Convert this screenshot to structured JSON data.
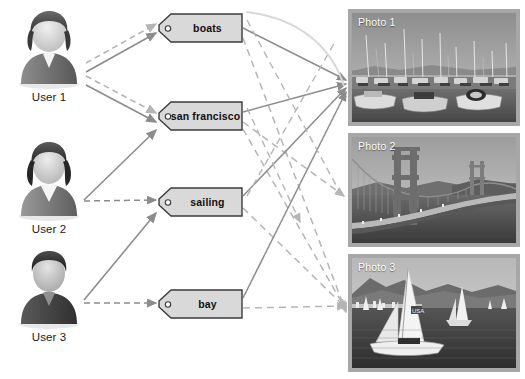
{
  "diagram": {
    "type": "tripartite-graph",
    "colors": {
      "tag_fill": "#d9d9d9",
      "tag_stroke": "#3b3b3b",
      "solid_edge": "#8c8c8c",
      "dashed_edge": "#b5b5b5",
      "photo_frame": "#a7a7a7",
      "label_text": "#ffffff",
      "background": "#ffffff"
    }
  },
  "users": [
    {
      "id": "user1",
      "label": "User 1",
      "avatar_icon": "user-avatar-icon"
    },
    {
      "id": "user2",
      "label": "User 2",
      "avatar_icon": "user-avatar-icon"
    },
    {
      "id": "user3",
      "label": "User 3",
      "avatar_icon": "user-avatar-icon"
    }
  ],
  "tags": [
    {
      "id": "boats",
      "label": "boats",
      "hole_icon": "tag-hole-icon"
    },
    {
      "id": "sanfrancisco",
      "label": "san francisco",
      "hole_icon": "tag-hole-icon"
    },
    {
      "id": "sailing",
      "label": "sailing",
      "hole_icon": "tag-hole-icon"
    },
    {
      "id": "bay",
      "label": "bay",
      "hole_icon": "tag-hole-icon"
    }
  ],
  "photos": [
    {
      "id": "photo1",
      "label": "Photo 1",
      "subject": "marina with moored sailboats"
    },
    {
      "id": "photo2",
      "label": "Photo 2",
      "subject": "golden gate bridge"
    },
    {
      "id": "photo3",
      "label": "Photo 3",
      "subject": "sailboats on the bay"
    }
  ],
  "edges": {
    "user_to_tag": [
      {
        "from": "user1",
        "to": "boats",
        "style": "solid"
      },
      {
        "from": "user1",
        "to": "boats",
        "style": "dashed"
      },
      {
        "from": "user1",
        "to": "sanfrancisco",
        "style": "solid"
      },
      {
        "from": "user1",
        "to": "sanfrancisco",
        "style": "dashed"
      },
      {
        "from": "user2",
        "to": "sanfrancisco",
        "style": "solid"
      },
      {
        "from": "user2",
        "to": "sailing",
        "style": "dashed"
      },
      {
        "from": "user3",
        "to": "sailing",
        "style": "solid"
      },
      {
        "from": "user3",
        "to": "bay",
        "style": "dashed"
      }
    ],
    "tag_to_photo": [
      {
        "from": "boats",
        "to": "photo1",
        "style": "solid"
      },
      {
        "from": "boats",
        "to": "photo3",
        "style": "dashed"
      },
      {
        "from": "sanfrancisco",
        "to": "photo1",
        "style": "solid"
      },
      {
        "from": "sanfrancisco",
        "to": "photo2",
        "style": "dashed"
      },
      {
        "from": "sanfrancisco",
        "to": "photo3",
        "style": "dashed"
      },
      {
        "from": "sailing",
        "to": "photo1",
        "style": "solid"
      },
      {
        "from": "sailing",
        "to": "photo3",
        "style": "dashed"
      },
      {
        "from": "bay",
        "to": "photo1",
        "style": "solid"
      },
      {
        "from": "bay",
        "to": "photo3",
        "style": "dashed"
      }
    ]
  }
}
